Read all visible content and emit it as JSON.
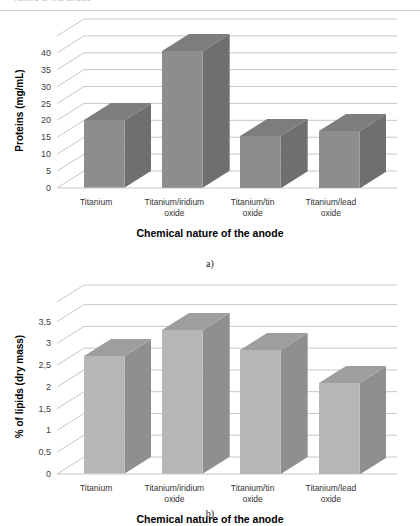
{
  "page": {
    "top_header_fragment": "nature of the anode",
    "caption_a": "a)",
    "caption_b": "b)"
  },
  "palette": {
    "bar_a_front": "#8d8d8d",
    "bar_a_side": "#6f6f6f",
    "bar_a_top": "#7d7d7d",
    "bar_b_front": "#b6b6b6",
    "bar_b_side": "#8f8f8f",
    "bar_b_top": "#9e9e9e",
    "gridline": "#c7c7c7",
    "axis_text": "#404040",
    "title_text": "#000000"
  },
  "chart_data": [
    {
      "id": "chart-a",
      "type": "bar",
      "title": "",
      "xlabel": "Chemical nature of the anode",
      "ylabel": "Proteins (mg/mL)",
      "categories": [
        "Titanium",
        "Titanium/iridium\noxide",
        "Titanium/tin\noxide",
        "Titanium/lead\noxide"
      ],
      "values": [
        20,
        40.5,
        15.5,
        17
      ],
      "ylim": [
        0,
        45
      ],
      "yticks": [
        0,
        5,
        10,
        15,
        20,
        25,
        30,
        35,
        40
      ],
      "ytick_labels": [
        "0",
        "5",
        "10",
        "15",
        "20",
        "25",
        "30",
        "35",
        "40"
      ],
      "grid": true,
      "legend": "none",
      "style": "3d-column"
    },
    {
      "id": "chart-b",
      "type": "bar",
      "title": "",
      "xlabel": "Chemical nature of the anode",
      "ylabel": "% of lipids  (dry mass)",
      "categories": [
        "Titanium",
        "Titanium/iridium\noxide",
        "Titanium/tin\noxide",
        "Titanium/lead\noxide"
      ],
      "values": [
        2.7,
        3.3,
        2.85,
        2.1
      ],
      "ylim": [
        0,
        3.95
      ],
      "yticks": [
        0,
        0.5,
        1,
        1.5,
        2,
        2.5,
        3,
        3.5
      ],
      "ytick_labels": [
        "0",
        "0,5",
        "1",
        "1,5",
        "2",
        "2,5",
        "3",
        "3,5"
      ],
      "grid": true,
      "legend": "none",
      "style": "3d-column"
    }
  ]
}
